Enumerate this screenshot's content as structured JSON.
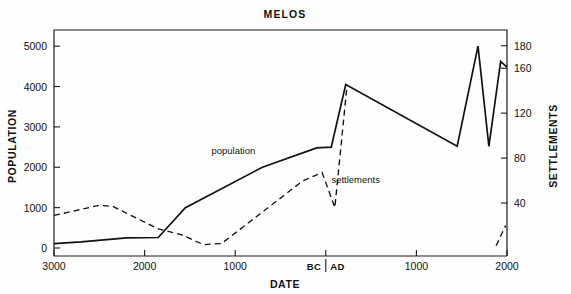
{
  "chart_data": {
    "type": "line",
    "title": "MELOS",
    "xlabel": "DATE",
    "ylabel": "POPULATION",
    "y2label": "SETTLEMENTS",
    "grid": false,
    "legend": "inline-annotations",
    "x_tick_labels": [
      "3000",
      "2000",
      "1000",
      "BC",
      "AD",
      "1000",
      "2000"
    ],
    "x_era_divider": "BC | AD",
    "xlim_years": [
      -3000,
      2000
    ],
    "y_tick_labels": [
      "0",
      "1000",
      "2000",
      "3000",
      "4000",
      "5000"
    ],
    "ylim": [
      0,
      5400
    ],
    "y2_tick_labels": [
      "40",
      "80",
      "120",
      "160",
      "180"
    ],
    "y2lim": [
      0,
      194
    ],
    "annotations": [
      {
        "text": "population",
        "year": -1020,
        "value": 2320
      },
      {
        "text": "settlements",
        "year": 330,
        "value": 1620
      }
    ],
    "series": [
      {
        "name": "population",
        "style": "solid",
        "axis": "left",
        "units": "people",
        "points": [
          {
            "year": -3000,
            "value": 110
          },
          {
            "year": -2700,
            "value": 150
          },
          {
            "year": -2200,
            "value": 250
          },
          {
            "year": -1850,
            "value": 260
          },
          {
            "year": -1550,
            "value": 1000
          },
          {
            "year": -700,
            "value": 2000
          },
          {
            "year": -100,
            "value": 2480
          },
          {
            "year": 60,
            "value": 2500
          },
          {
            "year": 220,
            "value": 4050
          },
          {
            "year": 1450,
            "value": 2520
          },
          {
            "year": 1680,
            "value": 5000
          },
          {
            "year": 1800,
            "value": 2520
          },
          {
            "year": 1930,
            "value": 4620
          },
          {
            "year": 2000,
            "value": 4480
          }
        ]
      },
      {
        "name": "settlements",
        "style": "dashed",
        "axis": "right",
        "units": "settlements",
        "points": [
          {
            "year": -3000,
            "value": 29
          },
          {
            "year": -2500,
            "value": 38
          },
          {
            "year": -2350,
            "value": 37
          },
          {
            "year": -1850,
            "value": 17
          },
          {
            "year": -1600,
            "value": 12
          },
          {
            "year": -1350,
            "value": 3
          },
          {
            "year": -1150,
            "value": 4
          },
          {
            "year": -250,
            "value": 60
          },
          {
            "year": -40,
            "value": 67
          },
          {
            "year": 100,
            "value": 36
          },
          {
            "year": 230,
            "value": 141
          }
        ]
      },
      {
        "name": "settlements-modern-fragment",
        "style": "dashed",
        "axis": "right",
        "units": "settlements",
        "points": [
          {
            "year": 1880,
            "value": 2
          },
          {
            "year": 1985,
            "value": 20
          }
        ]
      }
    ]
  }
}
